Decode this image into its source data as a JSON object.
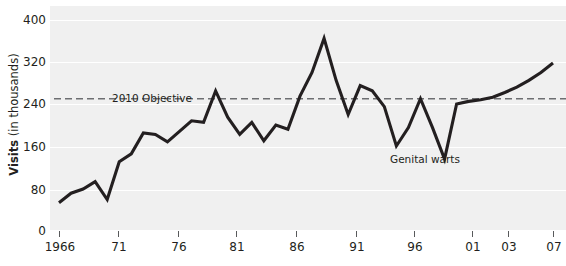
{
  "axis": {
    "y_title_strong": "Visits",
    "y_title_light": " (in thousands)",
    "y_ticks": [
      "400",
      "320",
      "240",
      "160",
      "80",
      "0"
    ],
    "x_ticks": [
      "1966",
      "71",
      "76",
      "81",
      "86",
      "91",
      "96",
      "01",
      "03",
      "07"
    ]
  },
  "annotations": {
    "objective": "2010 Objective",
    "series": "Genital warts"
  },
  "colors": {
    "plot_background": "#f0f0f0",
    "gridline": "#ffffff",
    "series_line": "#231f20",
    "objective_line": "#6d6e71",
    "text": "#231f20"
  },
  "chart_data": {
    "type": "line",
    "title": "",
    "xlabel": "",
    "ylabel": "Visits (in thousands)",
    "xlim": [
      1966,
      2007
    ],
    "ylim": [
      0,
      400
    ],
    "yticks": [
      0,
      80,
      160,
      240,
      320,
      400
    ],
    "xticks": [
      1966,
      1971,
      1976,
      1981,
      1986,
      1991,
      1996,
      2001,
      2003,
      2007
    ],
    "xticklabels": [
      "1966",
      "71",
      "76",
      "81",
      "86",
      "91",
      "96",
      "01",
      "03",
      "07"
    ],
    "grid": "horizontal",
    "legend": "none",
    "series": [
      {
        "name": "Genital warts",
        "label_annotation": "Genital warts",
        "color": "#231f20",
        "x": [
          1966,
          1967,
          1968,
          1969,
          1970,
          1971,
          1972,
          1973,
          1974,
          1975,
          1976,
          1977,
          1978,
          1979,
          1980,
          1981,
          1982,
          1983,
          1984,
          1985,
          1986,
          1987,
          1988,
          1989,
          1990,
          1991,
          1992,
          1993,
          1994,
          1995,
          1996,
          1997,
          1998,
          1999,
          2000,
          2001,
          2002,
          2003,
          2004,
          2005,
          2006,
          2007
        ],
        "values": [
          52,
          70,
          78,
          92,
          58,
          130,
          145,
          185,
          182,
          168,
          188,
          208,
          205,
          265,
          215,
          182,
          205,
          170,
          200,
          192,
          255,
          300,
          365,
          285,
          220,
          275,
          265,
          235,
          160,
          195,
          250,
          195,
          135,
          240,
          245,
          248,
          253,
          262,
          272,
          285,
          300,
          318
        ]
      }
    ],
    "reference_lines": [
      {
        "name": "2010 Objective",
        "label": "2010 Objective",
        "value": 250,
        "orientation": "horizontal",
        "style": "dashed",
        "color": "#6d6e71"
      }
    ]
  }
}
